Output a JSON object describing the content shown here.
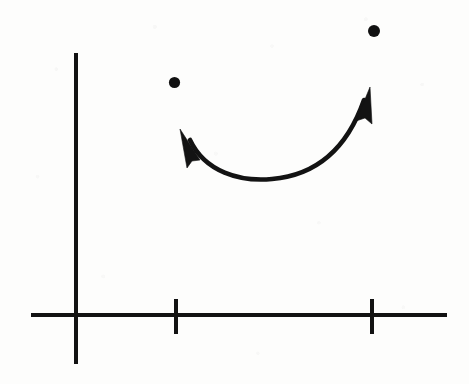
{
  "document": {
    "kind": "scanned-hand-drawn-math-figure",
    "width": 469,
    "height": 384,
    "background_color": "#fdfdfc",
    "ink_color": "#121212",
    "caption": ""
  },
  "chart_data": {
    "type": "scatter",
    "title": "",
    "subtitle": "",
    "xlabel": "",
    "ylabel": "",
    "grid": false,
    "legend": null,
    "axes": {
      "origin": {
        "x": 77,
        "y": 315
      },
      "x_axis": {
        "name": "x-axis",
        "from": {
          "x": 31,
          "y": 315
        },
        "to": {
          "x": 447,
          "y": 315
        },
        "stroke_width": 4,
        "tick_labels": [],
        "ticks": [
          {
            "name": "tick-1",
            "x": 176,
            "top": 299,
            "bottom": 334,
            "label": ""
          },
          {
            "name": "tick-2",
            "x": 372,
            "top": 299,
            "bottom": 334,
            "label": ""
          }
        ]
      },
      "y_axis": {
        "name": "y-axis",
        "x": 76,
        "top": 53,
        "bottom": 364,
        "stroke_width": 4,
        "ticks": [],
        "tick_labels": []
      }
    },
    "points": [
      {
        "name": "left-point",
        "cx": 174.5,
        "cy": 82.5,
        "r": 5.6,
        "label": ""
      },
      {
        "name": "right-point",
        "cx": 374,
        "cy": 31,
        "r": 6.0,
        "label": ""
      }
    ],
    "annotations": [
      {
        "name": "double-headed-curved-arrow",
        "type": "curved-double-arrow",
        "description": "U-shaped curve sweeping from the left point down and back up to the right point, arrowheads at both ends",
        "path": "M 190 140 C 205 172, 240 182, 272 179 C 318 175, 348 146, 364 100",
        "stroke_width": 4.6,
        "start_tip": {
          "x": 180,
          "y": 129
        },
        "end_tip": {
          "x": 370,
          "y": 87
        },
        "start_arrowhead": "M 180 129 L 200 160 L 192 161 L 187 168 Z",
        "end_arrowhead": "M 370 87 L 372 124 L 365 118 L 356 121 Z"
      }
    ],
    "xlim": [
      31,
      447
    ],
    "ylim": [
      53,
      364
    ]
  }
}
